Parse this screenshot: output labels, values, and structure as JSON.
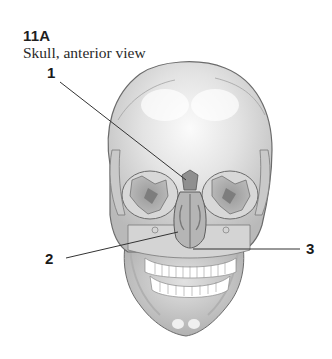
{
  "figure": {
    "number": "11A",
    "title": "Skull, anterior view"
  },
  "labels": [
    {
      "id": "1",
      "text": "1"
    },
    {
      "id": "2",
      "text": "2"
    },
    {
      "id": "3",
      "text": "3"
    }
  ],
  "colors": {
    "bone_light": "#e6e6e6",
    "bone_mid": "#c4c4c4",
    "bone_dark": "#8f8f8f",
    "outline": "#6b6b6b",
    "leader_line": "#333333",
    "teeth": "#ffffff"
  }
}
